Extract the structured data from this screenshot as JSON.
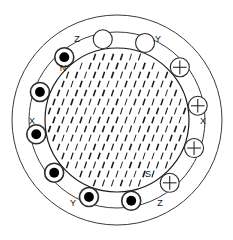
{
  "diagram": {
    "geometry": {
      "center_x": 117,
      "center_y": 120,
      "outer_radius": 105,
      "stator_bore_radius": 88,
      "rotor_radius": 72,
      "coil_radius": 9.5,
      "coil_ring_radius": 82
    },
    "colors": {
      "outline": "#3a3a3a",
      "rotor_outline": "#1a1a1a",
      "hatch": "#1a1a1a",
      "coil_outline": "#2a2a2a",
      "coil_fill_empty": "#ffffff",
      "coil_dot_fill": "#000000",
      "background": "#ffffff",
      "text": "#111111"
    },
    "hatch": {
      "angle_deg": 72,
      "dash_length": 7,
      "spacing_x": 9,
      "spacing_y": 9
    }
  },
  "phase_labels": [
    {
      "name": "phase-label-z-top",
      "text": "Z",
      "x": 77,
      "y": 42
    },
    {
      "name": "phase-label-y-top",
      "text": "Y",
      "x": 158,
      "y": 42
    },
    {
      "name": "phase-label-x-left",
      "text": "X",
      "x": 32,
      "y": 124
    },
    {
      "name": "phase-label-x-right",
      "text": "X",
      "x": 203,
      "y": 124
    },
    {
      "name": "phase-label-y-bottom",
      "text": "Y",
      "x": 73,
      "y": 206
    },
    {
      "name": "phase-label-z-bottom",
      "text": "Z",
      "x": 160,
      "y": 206
    }
  ],
  "pole_labels": [
    {
      "name": "pole-label-north",
      "text": "N",
      "x": 63,
      "y": 71
    },
    {
      "name": "pole-label-south",
      "text": "S",
      "x": 148,
      "y": 177
    }
  ],
  "coils": [
    {
      "name": "coil-z-a",
      "phase": "Z",
      "polarity": "dot",
      "angle_deg": 250
    },
    {
      "name": "coil-z-b",
      "phase": "Z",
      "polarity": "dot",
      "angle_deg": 280
    },
    {
      "name": "coil-y-a",
      "phase": "Y",
      "polarity": "plus",
      "angle_deg": 310
    },
    {
      "name": "coil-y-b",
      "phase": "Y",
      "polarity": "plus",
      "angle_deg": 340
    },
    {
      "name": "coil-x-a",
      "phase": "X",
      "polarity": "plus",
      "angle_deg": 10
    },
    {
      "name": "coil-x-b",
      "phase": "X",
      "polarity": "plus",
      "angle_deg": 40
    },
    {
      "name": "coil-z-c",
      "phase": "Z",
      "polarity": "open",
      "angle_deg": 70
    },
    {
      "name": "coil-z-d",
      "phase": "Z",
      "polarity": "open",
      "angle_deg": 100
    },
    {
      "name": "coil-y-c",
      "phase": "Y",
      "polarity": "fill",
      "angle_deg": 130
    },
    {
      "name": "coil-y-d",
      "phase": "Y",
      "polarity": "fill",
      "angle_deg": 160
    },
    {
      "name": "coil-x-c",
      "phase": "X",
      "polarity": "fill",
      "angle_deg": 190
    },
    {
      "name": "coil-x-d",
      "phase": "X",
      "polarity": "fill",
      "angle_deg": 220
    }
  ]
}
